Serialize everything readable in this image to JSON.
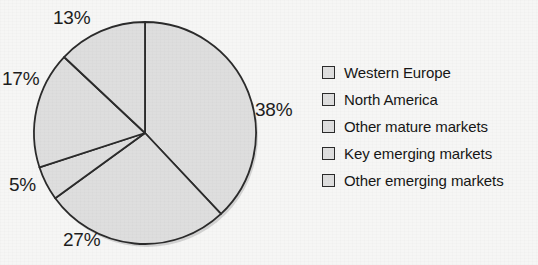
{
  "title_remnant": "",
  "chart_data": {
    "type": "pie",
    "title": "",
    "subtitle": "",
    "xlabel": "",
    "ylabel": "",
    "legend_position": "right",
    "grid": false,
    "start_angle_deg": 0,
    "direction": "clockwise",
    "categories": [
      "Western Europe",
      "North America",
      "Other mature markets",
      "Key emerging markets",
      "Other emerging markets"
    ],
    "values": [
      38,
      27,
      5,
      17,
      13
    ],
    "labels": [
      "38%",
      "27%",
      "5%",
      "17%",
      "13%"
    ],
    "units": "percent",
    "slice_fill": "#dedede",
    "slice_stroke": "#2b2b2b",
    "background": "#f6f6f5",
    "text_color": "#1d1d1d",
    "slices": [
      {
        "name": "Western Europe",
        "value": 38,
        "label": "38%",
        "start_deg": 0,
        "end_deg": 136.8
      },
      {
        "name": "North America",
        "value": 27,
        "label": "27%",
        "start_deg": 136.8,
        "end_deg": 234.0
      },
      {
        "name": "Other mature markets",
        "value": 5,
        "label": "5%",
        "start_deg": 234.0,
        "end_deg": 252.0
      },
      {
        "name": "Key emerging markets",
        "value": 17,
        "label": "17%",
        "start_deg": 252.0,
        "end_deg": 313.2
      },
      {
        "name": "Other emerging markets",
        "value": 13,
        "label": "13%",
        "start_deg": 313.2,
        "end_deg": 360.0
      }
    ]
  },
  "pct_labels": [
    {
      "text": "38%",
      "left": 255,
      "top": 99
    },
    {
      "text": "27%",
      "left": 63,
      "top": 229
    },
    {
      "text": "5%",
      "left": 9,
      "top": 174
    },
    {
      "text": "17%",
      "left": 2,
      "top": 68
    },
    {
      "text": "13%",
      "left": 53,
      "top": 7
    }
  ],
  "legend": {
    "items": [
      {
        "label": "Western Europe"
      },
      {
        "label": "North America"
      },
      {
        "label": "Other mature markets"
      },
      {
        "label": "Key emerging markets"
      },
      {
        "label": "Other emerging markets"
      }
    ]
  }
}
